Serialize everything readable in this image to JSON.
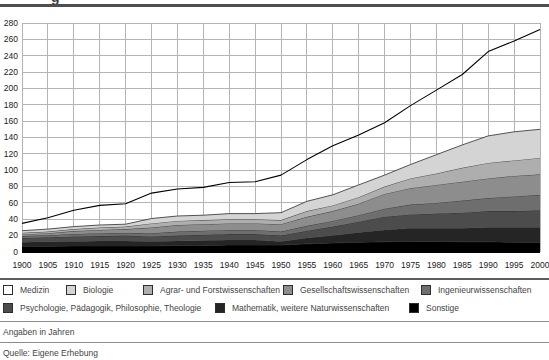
{
  "clipped_title": {
    "visible_fragment": "g"
  },
  "chart_data": {
    "type": "area",
    "stacked": true,
    "title": "",
    "xlabel": "",
    "ylabel": "",
    "x": [
      1900,
      1905,
      1910,
      1915,
      1920,
      1925,
      1930,
      1935,
      1940,
      1945,
      1950,
      1955,
      1960,
      1965,
      1970,
      1975,
      1980,
      1985,
      1990,
      1995,
      2000
    ],
    "xlim": [
      1900,
      2000
    ],
    "x_tick_step": 5,
    "ylim": [
      0,
      280
    ],
    "y_tick_step": 20,
    "grid": true,
    "legend_position": "bottom",
    "series_bottom_to_top": [
      {
        "name": "Sonstige",
        "color": "#000000",
        "values": [
          7,
          7,
          7.5,
          7.5,
          7.5,
          7.5,
          8,
          8,
          8.5,
          8.5,
          8.5,
          10,
          11,
          12,
          12.5,
          13,
          13,
          12.5,
          12.5,
          12,
          12
        ]
      },
      {
        "name": "Mathematik, weitere Naturwissenschaften",
        "color": "#252525",
        "values": [
          5,
          5.5,
          5.5,
          6,
          6,
          5.5,
          5.5,
          6,
          6,
          6,
          4.5,
          7,
          9,
          12,
          14.5,
          16,
          16,
          16.5,
          17.5,
          18,
          18
        ]
      },
      {
        "name": "Psychologie, Pädagogik, Philosophie, Theologie",
        "color": "#4c4c4c",
        "values": [
          5,
          5.5,
          6,
          6,
          6.5,
          6,
          6.5,
          7,
          7.5,
          7.5,
          7,
          9,
          11,
          13,
          16,
          17,
          18,
          19,
          20,
          20,
          21
        ]
      },
      {
        "name": "Ingenieurwissenschaften",
        "color": "#6e6e6e",
        "values": [
          2.5,
          2.5,
          3,
          3.5,
          3.5,
          4,
          5,
          5,
          5,
          5,
          5,
          6,
          7,
          8,
          10,
          12,
          13,
          15,
          16,
          18,
          19
        ]
      },
      {
        "name": "Gesellschaftswissenschaften",
        "color": "#8d8d8d",
        "values": [
          2,
          2.5,
          3.5,
          4,
          4.5,
          7,
          8,
          8,
          8,
          8,
          9,
          11,
          12,
          14,
          18,
          20,
          22,
          23,
          24,
          25,
          25
        ]
      },
      {
        "name": "Agrar- und Forstwissenschaften",
        "color": "#aeaeae",
        "values": [
          2,
          2,
          2.5,
          3,
          3,
          5,
          5,
          5,
          5,
          5,
          5,
          7,
          7,
          8,
          9,
          12,
          14,
          17,
          19,
          19,
          20
        ]
      },
      {
        "name": "Biologie",
        "color": "#d4d4d4",
        "values": [
          2.5,
          3,
          3,
          3,
          3,
          6,
          6,
          6,
          7,
          7,
          9,
          12,
          13,
          15,
          14,
          17,
          23,
          28,
          33,
          35,
          35
        ]
      },
      {
        "name": "Medizin",
        "color": "#ffffff",
        "fill": "none",
        "values": [
          9,
          14,
          20,
          24,
          25,
          31,
          33,
          34,
          38,
          39,
          46,
          51,
          60,
          61,
          64,
          72,
          79,
          86,
          103,
          111,
          122
        ]
      }
    ],
    "totals": [
      35,
      42,
      51,
      57,
      59,
      72,
      77,
      79,
      85,
      86,
      94,
      113,
      130,
      143,
      158,
      179,
      198,
      217,
      245,
      258,
      272
    ]
  },
  "legend": {
    "rows": [
      [
        {
          "label": "Medizin",
          "color": "#ffffff"
        },
        {
          "label": "Biologie",
          "color": "#d4d4d4"
        },
        {
          "label": "Agrar- und Forstwissenschaften",
          "color": "#aeaeae"
        },
        {
          "label": "Gesellschaftswissenschaften",
          "color": "#8d8d8d"
        },
        {
          "label": "Ingenieurwissenschaften",
          "color": "#6e6e6e"
        }
      ],
      [
        {
          "label": "Psychologie, Pädagogik, Philosophie, Theologie",
          "color": "#4c4c4c"
        },
        {
          "label": "Mathematik, weitere Naturwissenschaften",
          "color": "#252525"
        },
        {
          "label": "Sonstige",
          "color": "#000000"
        }
      ]
    ]
  },
  "footer": {
    "note": "Angaben in Jahren",
    "source": "Quelle: Eigene Erhebung"
  },
  "colors": {
    "grid": "#b4b4b4",
    "boundary_line": "#2b2b2b",
    "total_line": "#000000",
    "axis_text": "#1a1a1a"
  }
}
